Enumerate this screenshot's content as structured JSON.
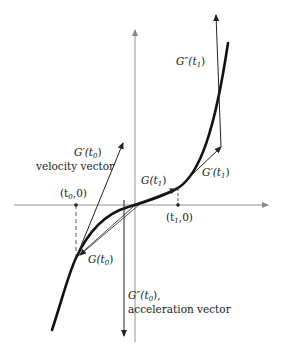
{
  "diagram": {
    "type": "parametric curve with velocity and acceleration vectors",
    "colors": {
      "curve": "#111111",
      "axes": "#888888",
      "vectors": "#222222",
      "text": "#222222",
      "background": "#ffffff"
    },
    "labels": {
      "g_double_prime_t1": {
        "main": "G″(t",
        "sub": "1",
        "close": ")"
      },
      "g_prime_t0": {
        "main": "G′(t",
        "sub": "0",
        "close": ")"
      },
      "velocity_vector": "velocity vector",
      "t0_point": {
        "open": "(t",
        "sub": "0",
        "close": ",0)"
      },
      "g_t1": {
        "main": "G(t",
        "sub": "1",
        "close": ")"
      },
      "g_prime_t1": {
        "main": "G′(t",
        "sub": "1",
        "close": ")"
      },
      "t1_point": {
        "open": "(t",
        "sub": "1",
        "close": ",0)"
      },
      "g_t0": {
        "main": "G(t",
        "sub": "0",
        "close": ")"
      },
      "g_double_prime_t0": {
        "main": "G″(t",
        "sub": "0",
        "close": "),"
      },
      "acceleration_vector": "acceleration vector"
    }
  }
}
